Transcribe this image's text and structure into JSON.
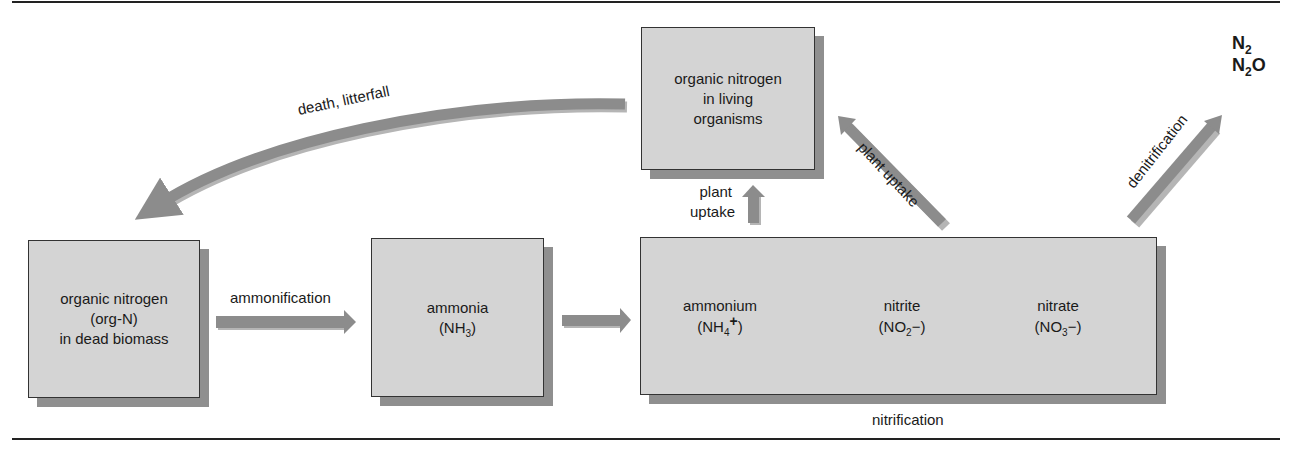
{
  "diagram": {
    "nodes": {
      "dead_biomass": {
        "line1": "organic nitrogen",
        "line2": "(org-N)",
        "line3": "in dead biomass"
      },
      "living": {
        "line1": "organic nitrogen",
        "line2": "in living",
        "line3": "organisms"
      },
      "ammonia": {
        "name": "ammonia",
        "formula_main": "(NH",
        "formula_sub": "3",
        "formula_end": ")"
      },
      "ammonium": {
        "name": "ammonium",
        "formula_main": "(NH",
        "formula_sub": "4",
        "formula_sup": "+",
        "formula_end": ")"
      },
      "nitrite": {
        "name": "nitrite",
        "formula_main": "(NO",
        "formula_sub": "2",
        "formula_sup": "−",
        "formula_end": ")"
      },
      "nitrate": {
        "name": "nitrate",
        "formula_main": "(NO",
        "formula_sub": "3",
        "formula_sup": "−",
        "formula_end": ")"
      },
      "gases": {
        "n2_main": "N",
        "n2_sub": "2",
        "n2o_main": "N",
        "n2o_sub": "2",
        "n2o_end": "O"
      }
    },
    "edges": {
      "ammonification": "ammonification",
      "death_litterfall": "death, litterfall",
      "plant_uptake_vertical_1": "plant",
      "plant_uptake_vertical_2": "uptake",
      "plant_uptake_diagonal": "plant uptake",
      "denitrification": "denitrification",
      "nitrification": "nitrification"
    },
    "colors": {
      "box_fill": "#d4d4d4",
      "box_shadow": "#8f8f8f",
      "arrow": "#8c8c8c",
      "arrow_shadow": "#b5b5b5",
      "text": "#1a1a1a"
    }
  }
}
